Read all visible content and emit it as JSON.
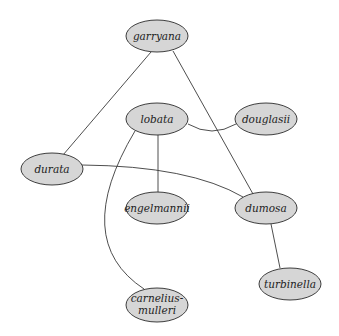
{
  "nodes": [
    {
      "id": "garryana",
      "label": "garryana",
      "cx": 157,
      "cy": 36,
      "rx": 31,
      "ry": 16
    },
    {
      "id": "lobata",
      "label": "lobata",
      "cx": 157,
      "cy": 119,
      "rx": 31,
      "ry": 16
    },
    {
      "id": "douglasii",
      "label": "douglasii",
      "cx": 266,
      "cy": 119,
      "rx": 31,
      "ry": 16
    },
    {
      "id": "durata",
      "label": "durata",
      "cx": 52,
      "cy": 169,
      "rx": 31,
      "ry": 16
    },
    {
      "id": "engelmannii",
      "label": "engelmannii",
      "cx": 157,
      "cy": 208,
      "rx": 31,
      "ry": 16
    },
    {
      "id": "dumosa",
      "label": "dumosa",
      "cx": 266,
      "cy": 208,
      "rx": 31,
      "ry": 16
    },
    {
      "id": "turbinella",
      "label": "turbinella",
      "cx": 290,
      "cy": 284,
      "rx": 31,
      "ry": 16
    },
    {
      "id": "carnelius-mulleri",
      "label_line1": "carnelius-",
      "label_line2": "mulleri",
      "cx": 157,
      "cy": 305,
      "rx": 31,
      "ry": 17
    }
  ],
  "edges": [
    [
      "garryana",
      "durata"
    ],
    [
      "garryana",
      "dumosa"
    ],
    [
      "lobata",
      "douglasii"
    ],
    [
      "lobata",
      "engelmannii"
    ],
    [
      "lobata",
      "carnelius-mulleri"
    ],
    [
      "durata",
      "dumosa"
    ],
    [
      "dumosa",
      "turbinella"
    ]
  ]
}
